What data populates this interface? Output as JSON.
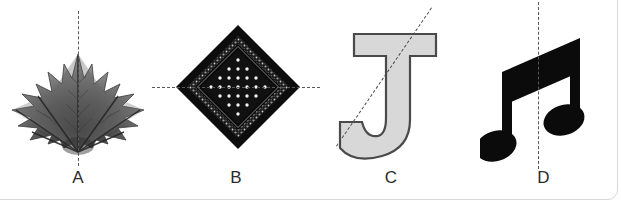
{
  "page": {
    "background_color": "#ffffff",
    "frame_border_color": "#d6d8da"
  },
  "figures": [
    {
      "id": "A",
      "caption": "A",
      "subject": "maple-leaf",
      "subject_description": "grayscale photographic maple leaf",
      "symmetry_line": {
        "orientation": "vertical",
        "style": "dashed",
        "color": "#555a5e"
      },
      "colors": {
        "fill_dark": "#3d3d3d",
        "fill_mid": "#6e6e6e",
        "fill_light": "#a8a8a8"
      }
    },
    {
      "id": "B",
      "caption": "B",
      "subject": "bandana-diamond",
      "subject_description": "black paisley bandana rotated 45 degrees with white dot grid",
      "symmetry_line": {
        "orientation": "horizontal",
        "style": "dashed",
        "color": "#555a5e"
      },
      "colors": {
        "border": "#0d0d0d",
        "paisley_band": "#6b6b6b",
        "field": "#111111",
        "dots": "#f2f2f2"
      }
    },
    {
      "id": "C",
      "caption": "C",
      "subject": "letter-j",
      "subject_description": "serif capital letter J, light gray fill with dark outline",
      "symmetry_line": {
        "orientation": "diagonal",
        "style": "dashed",
        "color": "#4a4f53",
        "angle_degrees": -55.5
      },
      "colors": {
        "fill": "#d8d8d8",
        "outline": "#4a4a4a"
      }
    },
    {
      "id": "D",
      "caption": "D",
      "subject": "beamed-eighth-notes",
      "subject_description": "pair of beamed eighth notes in solid black",
      "symmetry_line": {
        "orientation": "vertical",
        "style": "dashed",
        "color": "#555a5e"
      },
      "colors": {
        "fill": "#0b0b0b"
      }
    }
  ]
}
